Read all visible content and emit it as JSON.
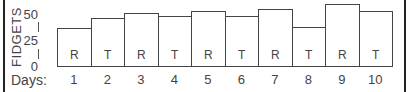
{
  "chart_data": {
    "type": "bar",
    "title": "",
    "xlabel": "Days:",
    "ylabel": "FIDGETS",
    "ylim": [
      0,
      62
    ],
    "yticks": [
      0,
      25,
      50
    ],
    "categories": [
      "1",
      "2",
      "3",
      "4",
      "5",
      "6",
      "7",
      "8",
      "9",
      "10"
    ],
    "values": [
      38,
      48,
      53,
      50,
      55,
      50,
      57,
      39,
      62,
      55
    ],
    "bar_labels": [
      "R",
      "T",
      "R",
      "T",
      "R",
      "T",
      "R",
      "T",
      "R",
      "T"
    ],
    "grid": false,
    "legend": null
  },
  "axis": {
    "ylabel": "FIDGETS",
    "xlabel": "Days:",
    "ticks": [
      "50",
      "25",
      "0"
    ]
  }
}
